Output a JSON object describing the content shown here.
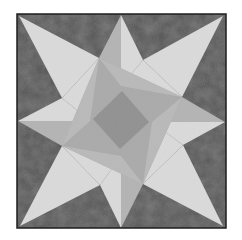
{
  "image": {
    "subject": "Eight-pointed star quilt block",
    "colors": {
      "background": "#ffffff",
      "frame_border": "#1e1e1e",
      "dark_fabric": "#4d4d4d",
      "light_fabric": "#dcdcdc",
      "medium_fabric": "#a9a9a9",
      "medium_light_fabric": "#b9b9b9",
      "center_diamond": "#8f8f8f"
    }
  }
}
